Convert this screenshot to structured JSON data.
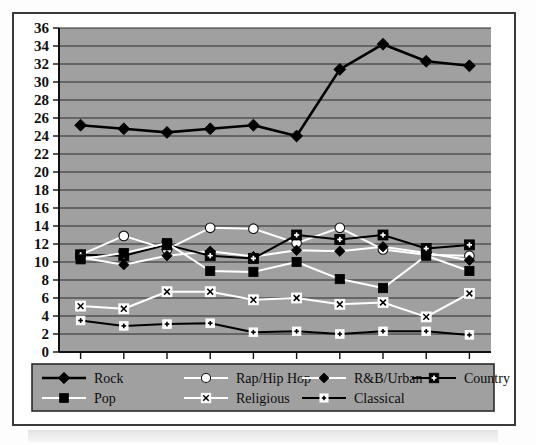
{
  "chart_data": {
    "type": "line",
    "title": "",
    "subtitle": "",
    "xlabel": "",
    "ylabel": "",
    "x": [
      "1999",
      "2000",
      "2001",
      "2002",
      "2003",
      "2004",
      "2005",
      "2006",
      "2007",
      "2008"
    ],
    "categories": [
      "1999",
      "2000",
      "2001",
      "2002",
      "2003",
      "2004",
      "2005",
      "2006",
      "2007",
      "2008"
    ],
    "ylim": [
      0,
      36
    ],
    "ytick_step": 2,
    "yticks": [
      "0",
      "2",
      "4",
      "6",
      "8",
      "10",
      "12",
      "14",
      "16",
      "18",
      "20",
      "22",
      "24",
      "26",
      "28",
      "30",
      "32",
      "34",
      "36"
    ],
    "grid": "horizontal",
    "legend_position": "bottom",
    "plot_background": "#a0a0a0",
    "series": [
      {
        "name": "Rock",
        "marker": "diamond",
        "marker_fill": "#000000",
        "line_color": "#000000",
        "values": [
          25.2,
          24.8,
          24.4,
          24.8,
          25.2,
          24.0,
          31.4,
          34.2,
          32.3,
          31.8
        ]
      },
      {
        "name": "Rap/Hip Hop",
        "marker": "circle",
        "marker_fill": "#ffffff",
        "line_color": "#ffffff",
        "values": [
          10.8,
          12.9,
          11.4,
          13.8,
          13.7,
          12.1,
          13.8,
          11.4,
          10.8,
          10.7
        ]
      },
      {
        "name": "R&B/Urban",
        "marker": "diamond",
        "marker_fill": "#000000",
        "line_color": "#ffffff",
        "values": [
          10.5,
          9.7,
          10.7,
          11.2,
          10.6,
          11.3,
          11.2,
          11.7,
          11.0,
          10.2
        ]
      },
      {
        "name": "Country",
        "marker": "square-plus",
        "marker_fill": "#000000",
        "line_color": "#000000",
        "values": [
          10.8,
          10.7,
          11.9,
          10.7,
          10.4,
          13.0,
          12.5,
          13.0,
          11.5,
          11.9
        ]
      },
      {
        "name": "Pop",
        "marker": "square",
        "marker_fill": "#000000",
        "line_color": "#ffffff",
        "values": [
          10.3,
          11.0,
          12.1,
          9.0,
          8.9,
          10.0,
          8.1,
          7.1,
          10.7,
          9.0
        ]
      },
      {
        "name": "Religious",
        "marker": "x-box",
        "marker_fill": "#ffffff",
        "line_color": "#ffffff",
        "values": [
          5.1,
          4.8,
          6.7,
          6.7,
          5.8,
          6.0,
          5.3,
          5.5,
          3.9,
          6.5
        ]
      },
      {
        "name": "Classical",
        "marker": "small-plus",
        "marker_fill": "#ffffff",
        "line_color": "#000000",
        "values": [
          3.5,
          2.9,
          3.1,
          3.2,
          2.2,
          2.3,
          2.0,
          2.3,
          2.3,
          1.9
        ]
      }
    ]
  },
  "legend": {
    "entries": [
      {
        "label": "Rock"
      },
      {
        "label": "Rap/Hip Hop"
      },
      {
        "label": "R&B/Urban"
      },
      {
        "label": "Country"
      },
      {
        "label": "Pop"
      },
      {
        "label": "Religious"
      },
      {
        "label": "Classical"
      }
    ]
  }
}
